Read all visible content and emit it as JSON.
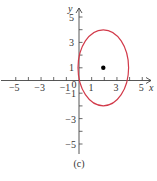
{
  "chart_data": {
    "type": "scatter",
    "title": "",
    "caption": "(c)",
    "xlabel": "x",
    "ylabel": "y",
    "xlim": [
      -5.5,
      5.5
    ],
    "ylim": [
      -5.5,
      5.5
    ],
    "grid": false,
    "x_tick_labels": [
      "-5",
      "-3",
      "-1",
      "0",
      "1",
      "3",
      "5"
    ],
    "y_tick_labels": [
      "5",
      "3",
      "1",
      "-1",
      "-3",
      "-5"
    ],
    "x_ticks": [
      -5,
      -4,
      -3,
      -2,
      -1,
      0,
      1,
      2,
      3,
      4,
      5
    ],
    "y_ticks": [
      -5,
      -4,
      -3,
      -2,
      -1,
      0,
      1,
      2,
      3,
      4,
      5
    ],
    "series": [
      {
        "name": "ellipse",
        "kind": "ellipse",
        "center": [
          2,
          1
        ],
        "semi_axis_x": 2,
        "semi_axis_y": 3,
        "color": "#d23a4a"
      },
      {
        "name": "center point",
        "kind": "point",
        "x": [
          2
        ],
        "y": [
          1
        ],
        "color": "#000000"
      }
    ],
    "colors": {
      "ellipse": "#d23a4a",
      "axes": "#444444",
      "point": "#000000"
    }
  }
}
